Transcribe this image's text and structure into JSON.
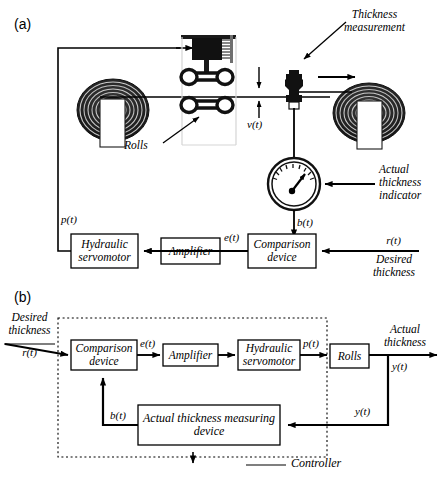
{
  "figure": {
    "panel_a_label": "(a)",
    "panel_b_label": "(b)"
  },
  "panel_a": {
    "title_annotations": {
      "thickness_measurement": "Thickness\nmeasurement",
      "rolls": "Rolls",
      "actual_thickness_indicator": "Actual\nthickness\nindicator"
    },
    "signals": {
      "v_of_t": "v(t)",
      "b_of_t": "b(t)",
      "e_of_t": "e(t)",
      "p_of_t": "p(t)",
      "r_of_t": "r(t)",
      "desired_thickness": "Desired\nthickness"
    },
    "blocks": [
      {
        "id": "hydraulic-servomotor",
        "label": "Hydraulic\nservomotor"
      },
      {
        "id": "amplifier",
        "label": "Amplifier"
      },
      {
        "id": "comparison-device",
        "label": "Comparison\ndevice"
      }
    ]
  },
  "panel_b": {
    "input_label": "Desired\nthickness",
    "input_signal": "r(t)",
    "output_label": "Actual\nthickness",
    "output_signal": "y(t)",
    "feedback_signal_right": "y(t)",
    "feedback_signal_left": "b(t)",
    "signal_e": "e(t)",
    "signal_p": "p(t)",
    "controller_label": "Controller",
    "blocks": [
      {
        "id": "comparison-device",
        "label": "Comparison\ndevice"
      },
      {
        "id": "amplifier",
        "label": "Amplifier"
      },
      {
        "id": "hydraulic-servomotor",
        "label": "Hydraulic\nservomotor"
      },
      {
        "id": "rolls",
        "label": "Rolls"
      },
      {
        "id": "actual-thickness-measuring-device",
        "label": "Actual thickness\nmeasuring device"
      }
    ]
  },
  "colors": {
    "line": "#000000",
    "background": "#ffffff",
    "coil_dark": "#2b2b2b"
  }
}
